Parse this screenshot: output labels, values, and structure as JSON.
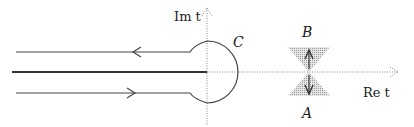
{
  "diagram": {
    "type": "complex-plane contour diagram",
    "axes": {
      "imaginary_label": "Im t",
      "real_label": "Re t",
      "style": "dotted"
    },
    "contour": {
      "label": "C",
      "description": "Hankel contour wrapping branch cut along negative real axis, circling origin",
      "upper_arrow_direction": "left",
      "lower_arrow_direction": "right"
    },
    "branch_cut": {
      "description": "thick line along negative real axis"
    },
    "saddle": {
      "upper_label": "B",
      "lower_label": "A",
      "shaded_regions": 2
    },
    "colors": {
      "line": "#333333",
      "axis": "#888888",
      "shade": "#bdbdbd"
    }
  }
}
